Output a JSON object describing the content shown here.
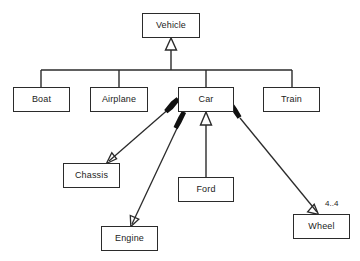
{
  "diagram": {
    "type": "uml-class-diagram",
    "canvas": {
      "width": 360,
      "height": 261,
      "background": "#ffffff"
    },
    "stroke_color": "#2b2b2b",
    "fill_color": "#ffffff",
    "classes": [
      {
        "id": "vehicle",
        "label": "Vehicle",
        "x": 142,
        "y": 13,
        "w": 58,
        "h": 25
      },
      {
        "id": "boat",
        "label": "Boat",
        "x": 13,
        "y": 87,
        "w": 57,
        "h": 25
      },
      {
        "id": "airplane",
        "label": "Airplane",
        "x": 90,
        "y": 87,
        "w": 58,
        "h": 25
      },
      {
        "id": "car",
        "label": "Car",
        "x": 178,
        "y": 87,
        "w": 56,
        "h": 25
      },
      {
        "id": "train",
        "label": "Train",
        "x": 263,
        "y": 87,
        "w": 57,
        "h": 25
      },
      {
        "id": "chassis",
        "label": "Chassis",
        "x": 63,
        "y": 163,
        "w": 57,
        "h": 25
      },
      {
        "id": "ford",
        "label": "Ford",
        "x": 178,
        "y": 177,
        "w": 56,
        "h": 25
      },
      {
        "id": "engine",
        "label": "Engine",
        "x": 101,
        "y": 226,
        "w": 57,
        "h": 25
      },
      {
        "id": "wheel",
        "label": "Wheel",
        "x": 293,
        "y": 214,
        "w": 57,
        "h": 25
      }
    ],
    "relationships": [
      {
        "id": "boat-vehicle",
        "from": "boat",
        "to": "vehicle",
        "kind": "generalization",
        "marker": "hollow-triangle",
        "label": ""
      },
      {
        "id": "airplane-vehicle",
        "from": "airplane",
        "to": "vehicle",
        "kind": "generalization",
        "marker": "hollow-triangle",
        "label": ""
      },
      {
        "id": "car-vehicle",
        "from": "car",
        "to": "vehicle",
        "kind": "generalization",
        "marker": "hollow-triangle",
        "label": ""
      },
      {
        "id": "train-vehicle",
        "from": "train",
        "to": "vehicle",
        "kind": "generalization",
        "marker": "hollow-triangle",
        "label": ""
      },
      {
        "id": "car-chassis",
        "from": "car",
        "to": "chassis",
        "kind": "composition",
        "marker": "filled-diamond",
        "label": ""
      },
      {
        "id": "car-engine",
        "from": "car",
        "to": "engine",
        "kind": "composition",
        "marker": "filled-diamond",
        "label": ""
      },
      {
        "id": "car-wheel",
        "from": "car",
        "to": "wheel",
        "kind": "composition",
        "marker": "filled-diamond",
        "label": "4..4"
      },
      {
        "id": "ford-car",
        "from": "ford",
        "to": "car",
        "kind": "generalization",
        "marker": "hollow-triangle",
        "label": ""
      }
    ],
    "labels": [
      {
        "id": "wheel-multiplicity",
        "text": "4..4",
        "x": 325,
        "y": 200
      }
    ]
  }
}
